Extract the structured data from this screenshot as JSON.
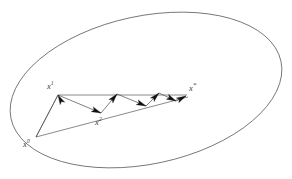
{
  "figure": {
    "background_color": "#ffffff",
    "stroke_color": "#4a4a4a",
    "label_color": "#3a3a3a",
    "arrow_color": "#111111",
    "width": 292,
    "height": 179
  },
  "ellipse": {
    "name": "level-set-ellipse",
    "center_x": 146,
    "center_y": 90,
    "radius_x": 138,
    "radius_y": 74,
    "rotation_deg": -12,
    "stroke_width": 0.7
  },
  "points": [
    {
      "id": "x0",
      "label": "x",
      "superscript": "0",
      "x": 36,
      "y": 137,
      "label_x": 23,
      "label_y": 140
    },
    {
      "id": "x1",
      "label": "x",
      "superscript": "1",
      "x": 58,
      "y": 95,
      "label_x": 47,
      "label_y": 82
    },
    {
      "id": "x2",
      "label": "x",
      "superscript": "2",
      "x": 101,
      "y": 113,
      "label_x": 95,
      "label_y": 118
    },
    {
      "id": "xstar",
      "label": "x",
      "superscript": "*",
      "x": 186,
      "y": 96,
      "label_x": 189,
      "label_y": 84
    }
  ],
  "guide_lines": [
    {
      "name": "line-x0-to-xstar",
      "x1": 36,
      "y1": 137,
      "x2": 188,
      "y2": 97
    },
    {
      "name": "line-x1-to-xstar",
      "x1": 58,
      "y1": 95,
      "x2": 187,
      "y2": 95
    },
    {
      "name": "line-x0-to-x1",
      "x1": 36,
      "y1": 137,
      "x2": 58,
      "y2": 95
    }
  ],
  "zigzag_segments": [
    {
      "name": "step-1",
      "from_x": 36,
      "from_y": 137,
      "to_x": 58,
      "to_y": 95,
      "arrow": true
    },
    {
      "name": "step-2",
      "from_x": 58,
      "from_y": 95,
      "to_x": 101,
      "to_y": 113,
      "arrow": true
    },
    {
      "name": "step-3",
      "from_x": 101,
      "from_y": 113,
      "to_x": 117,
      "to_y": 94,
      "arrow": true
    },
    {
      "name": "step-4",
      "from_x": 117,
      "from_y": 94,
      "to_x": 146,
      "to_y": 106,
      "arrow": true
    },
    {
      "name": "step-5",
      "from_x": 146,
      "from_y": 106,
      "to_x": 159,
      "to_y": 93,
      "arrow": true
    },
    {
      "name": "step-6",
      "from_x": 159,
      "from_y": 93,
      "to_x": 176,
      "to_y": 101,
      "arrow": true
    },
    {
      "name": "step-7",
      "from_x": 176,
      "from_y": 101,
      "to_x": 186,
      "to_y": 96,
      "arrow": true
    }
  ],
  "arrowheads": [
    {
      "name": "arrowhead-step-1",
      "tip_x": 58,
      "tip_y": 95,
      "angle_deg": 242
    },
    {
      "name": "arrowhead-step-2",
      "tip_x": 101,
      "tip_y": 113,
      "angle_deg": 23
    },
    {
      "name": "arrowhead-step-3",
      "tip_x": 117,
      "tip_y": 94,
      "angle_deg": 310
    },
    {
      "name": "arrowhead-step-4",
      "tip_x": 146,
      "tip_y": 106,
      "angle_deg": 23
    },
    {
      "name": "arrowhead-step-5",
      "tip_x": 159,
      "tip_y": 93,
      "angle_deg": 315
    },
    {
      "name": "arrowhead-step-6",
      "tip_x": 176,
      "tip_y": 101,
      "angle_deg": 26
    },
    {
      "name": "arrowhead-step-7",
      "tip_x": 186,
      "tip_y": 96,
      "angle_deg": 333
    }
  ]
}
